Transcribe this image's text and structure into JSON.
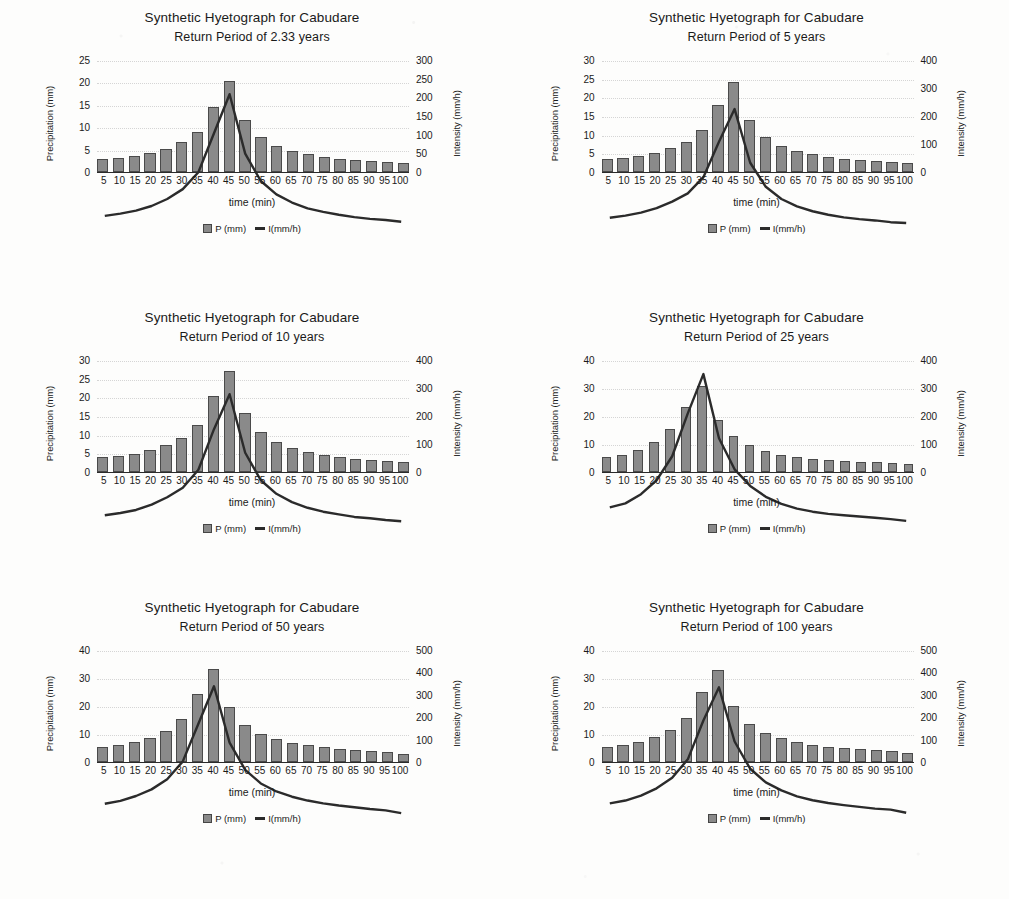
{
  "page": {
    "axis_titles": {
      "y_left": "Precipitation (mm)",
      "y_right": "Intensity (mm/h)",
      "x": "time (min)"
    },
    "legend": {
      "bars_label": "P (mm)",
      "line_label": "I(mm/h)"
    },
    "colors": {
      "bar_fill": "#8a8a8a",
      "bar_edge": "#4a4a4a",
      "line": "#2b2b2b",
      "gridline": "#d5d5d5",
      "text": "#1a1a1a",
      "background": "#fdfdfc"
    }
  },
  "chart_data": [
    {
      "type": "bar",
      "title": "Synthetic Hyetograph for Cabudare",
      "subtitle": "Return Period of 2.33 years",
      "xlabel": "time (min)",
      "ylabel": "Precipitation (mm)",
      "y2label": "Intensity (mm/h)",
      "grid": true,
      "legend_position": "bottom",
      "categories": [
        5,
        10,
        15,
        20,
        25,
        30,
        35,
        40,
        45,
        50,
        55,
        60,
        65,
        70,
        75,
        80,
        85,
        90,
        95,
        100
      ],
      "ylim": [
        0,
        25
      ],
      "yticks": [
        0,
        5,
        10,
        15,
        20,
        25
      ],
      "y2lim": [
        0,
        300
      ],
      "y2ticks": [
        0,
        50,
        100,
        150,
        200,
        250,
        300
      ],
      "series": [
        {
          "name": "P (mm)",
          "kind": "bar",
          "axis": "left",
          "values": [
            2.8,
            3.1,
            3.5,
            4.2,
            5.2,
            6.6,
            9.0,
            14.6,
            20.2,
            11.7,
            7.8,
            5.9,
            4.7,
            3.9,
            3.4,
            3.0,
            2.7,
            2.4,
            2.2,
            2.0,
            1.9
          ]
        },
        {
          "name": "I(mm/h)",
          "kind": "line",
          "axis": "right",
          "values": [
            34,
            38,
            43,
            51,
            63,
            80,
            109,
            176,
            243,
            141,
            94,
            71,
            57,
            47,
            41,
            36,
            32,
            29,
            27,
            24,
            23
          ]
        }
      ]
    },
    {
      "type": "bar",
      "title": "Synthetic Hyetograph for Cabudare",
      "subtitle": "Return Period of 5 years",
      "xlabel": "time (min)",
      "ylabel": "Precipitation (mm)",
      "y2label": "Intensity (mm/h)",
      "grid": true,
      "legend_position": "bottom",
      "categories": [
        5,
        10,
        15,
        20,
        25,
        30,
        35,
        40,
        45,
        50,
        55,
        60,
        65,
        70,
        75,
        80,
        85,
        90,
        95,
        100
      ],
      "ylim": [
        0,
        30
      ],
      "yticks": [
        0,
        5,
        10,
        15,
        20,
        25,
        30
      ],
      "y2lim": [
        0,
        400
      ],
      "y2ticks": [
        0,
        100,
        200,
        300,
        400
      ],
      "series": [
        {
          "name": "P (mm)",
          "kind": "bar",
          "axis": "left",
          "values": [
            3.4,
            3.8,
            4.4,
            5.2,
            6.5,
            8.1,
            11.2,
            17.9,
            24.2,
            13.9,
            9.3,
            7.0,
            5.6,
            4.7,
            4.0,
            3.5,
            3.2,
            2.9,
            2.6,
            2.4,
            2.2
          ]
        },
        {
          "name": "I(mm/h)",
          "kind": "line",
          "axis": "right",
          "values": [
            41,
            46,
            53,
            63,
            78,
            97,
            134,
            215,
            290,
            167,
            112,
            84,
            67,
            56,
            48,
            42,
            38,
            35,
            31,
            29,
            27
          ]
        }
      ]
    },
    {
      "type": "bar",
      "title": "Synthetic Hyetograph for Cabudare",
      "subtitle": "Return Period of 10 years",
      "xlabel": "time (min)",
      "ylabel": "Precipitation (mm)",
      "y2label": "Intensity (mm/h)",
      "grid": true,
      "legend_position": "bottom",
      "categories": [
        5,
        10,
        15,
        20,
        25,
        30,
        35,
        40,
        45,
        50,
        55,
        60,
        65,
        70,
        75,
        80,
        85,
        90,
        95,
        100
      ],
      "ylim": [
        0,
        30
      ],
      "yticks": [
        0,
        5,
        10,
        15,
        20,
        25,
        30
      ],
      "y2lim": [
        0,
        400
      ],
      "y2ticks": [
        0,
        100,
        200,
        300,
        400
      ],
      "series": [
        {
          "name": "P (mm)",
          "kind": "bar",
          "axis": "left",
          "values": [
            3.9,
            4.3,
            4.9,
            5.9,
            7.3,
            9.2,
            12.6,
            20.3,
            27.0,
            15.8,
            10.6,
            8.0,
            6.4,
            5.3,
            4.6,
            4.1,
            3.6,
            3.3,
            3.0,
            2.7,
            2.5
          ]
        },
        {
          "name": "I(mm/h)",
          "kind": "line",
          "axis": "right",
          "values": [
            47,
            52,
            59,
            71,
            88,
            110,
            151,
            244,
            324,
            190,
            127,
            96,
            77,
            64,
            55,
            49,
            43,
            40,
            36,
            33,
            30
          ]
        }
      ]
    },
    {
      "type": "bar",
      "title": "Synthetic Hyetograph for Cabudare",
      "subtitle": "Return Period of 25 years",
      "xlabel": "time (min)",
      "ylabel": "Precipitation (mm)",
      "y2label": "Intensity (mm/h)",
      "grid": true,
      "legend_position": "bottom",
      "categories": [
        5,
        10,
        15,
        20,
        25,
        30,
        35,
        40,
        45,
        50,
        55,
        60,
        65,
        70,
        75,
        80,
        85,
        90,
        95,
        100
      ],
      "ylim": [
        0,
        40
      ],
      "yticks": [
        0,
        10,
        20,
        30,
        40
      ],
      "y2lim": [
        0,
        400
      ],
      "y2ticks": [
        0,
        100,
        200,
        300,
        400
      ],
      "series": [
        {
          "name": "P (mm)",
          "kind": "bar",
          "axis": "left",
          "values": [
            5.4,
            6.2,
            7.9,
            10.6,
            15.2,
            23.3,
            30.8,
            18.6,
            12.7,
            9.5,
            7.4,
            6.1,
            5.2,
            4.6,
            4.2,
            3.9,
            3.7,
            3.4,
            3.2,
            2.8
          ]
        },
        {
          "name": "I(mm/h)",
          "kind": "line",
          "axis": "right",
          "values": [
            65,
            74,
            95,
            127,
            182,
            280,
            370,
            223,
            152,
            114,
            89,
            73,
            62,
            55,
            50,
            47,
            44,
            41,
            38,
            34
          ]
        }
      ]
    },
    {
      "type": "bar",
      "title": "Synthetic Hyetograph for Cabudare",
      "subtitle": "Return Period of 50 years",
      "xlabel": "time (min)",
      "ylabel": "Precipitation (mm)",
      "y2label": "Intensity (mm/h)",
      "grid": true,
      "legend_position": "bottom",
      "categories": [
        5,
        10,
        15,
        20,
        25,
        30,
        35,
        40,
        45,
        50,
        55,
        60,
        65,
        70,
        75,
        80,
        85,
        90,
        95,
        100
      ],
      "ylim": [
        0,
        40
      ],
      "yticks": [
        0,
        10,
        20,
        30,
        40
      ],
      "y2lim": [
        0,
        500
      ],
      "y2ticks": [
        0,
        100,
        200,
        300,
        400,
        500
      ],
      "series": [
        {
          "name": "P (mm)",
          "kind": "bar",
          "axis": "left",
          "values": [
            5.2,
            5.9,
            7.1,
            8.7,
            11.1,
            15.3,
            24.3,
            33.2,
            19.8,
            13.3,
            10.1,
            8.2,
            6.9,
            6.0,
            5.3,
            4.8,
            4.4,
            4.0,
            3.7,
            3.0
          ]
        },
        {
          "name": "I(mm/h)",
          "kind": "line",
          "axis": "right",
          "values": [
            63,
            71,
            85,
            104,
            133,
            184,
            292,
            399,
            238,
            160,
            121,
            98,
            83,
            72,
            64,
            58,
            53,
            48,
            44,
            36
          ]
        }
      ]
    },
    {
      "type": "bar",
      "title": "Synthetic Hyetograph for Cabudare",
      "subtitle": "Return Period of 100 years",
      "xlabel": "time (min)",
      "ylabel": "Precipitation (mm)",
      "y2label": "Intensity (mm/h)",
      "grid": true,
      "legend_position": "bottom",
      "categories": [
        5,
        10,
        15,
        20,
        25,
        30,
        35,
        40,
        45,
        50,
        55,
        60,
        65,
        70,
        75,
        80,
        85,
        90,
        95,
        100
      ],
      "ylim": [
        0,
        40
      ],
      "yticks": [
        0,
        10,
        20,
        30,
        40
      ],
      "y2lim": [
        0,
        500
      ],
      "y2ticks": [
        0,
        100,
        200,
        300,
        400,
        500
      ],
      "series": [
        {
          "name": "P (mm)",
          "kind": "bar",
          "axis": "left",
          "values": [
            5.3,
            6.0,
            7.2,
            8.9,
            11.4,
            15.8,
            25.1,
            33.0,
            20.1,
            13.6,
            10.3,
            8.4,
            7.0,
            6.1,
            5.4,
            4.9,
            4.5,
            4.1,
            3.8,
            3.1
          ]
        },
        {
          "name": "I(mm/h)",
          "kind": "line",
          "axis": "right",
          "values": [
            64,
            72,
            86,
            107,
            137,
            190,
            301,
            396,
            241,
            163,
            124,
            101,
            84,
            73,
            65,
            59,
            54,
            49,
            46,
            37
          ]
        }
      ]
    }
  ]
}
